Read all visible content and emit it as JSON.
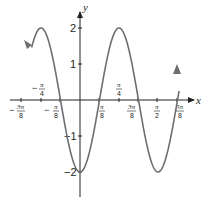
{
  "chart_data": {
    "type": "line",
    "title": "",
    "function": "y = -2cos(4x)",
    "xlabel": "x",
    "ylabel": "y",
    "xlim": [
      -0.4375,
      0.6875
    ],
    "xlim_units": "multiples of pi",
    "ylim": [
      -2.6,
      2.5
    ],
    "grid": false,
    "legend": null,
    "x_ticks": [
      {
        "value": "-3pi/8",
        "label_num": "3π",
        "label_den": "8",
        "sign": "−"
      },
      {
        "value": "-pi/4",
        "label_num": "π",
        "label_den": "4",
        "sign": "−"
      },
      {
        "value": "-pi/8",
        "label_num": "π",
        "label_den": "8",
        "sign": "−"
      },
      {
        "value": "pi/8",
        "label_num": "π",
        "label_den": "8",
        "sign": ""
      },
      {
        "value": "pi/4",
        "label_num": "π",
        "label_den": "4",
        "sign": ""
      },
      {
        "value": "3pi/8",
        "label_num": "3π",
        "label_den": "8",
        "sign": ""
      },
      {
        "value": "pi/2",
        "label_num": "π",
        "label_den": "2",
        "sign": ""
      },
      {
        "value": "5pi/8",
        "label_num": "5π",
        "label_den": "8",
        "sign": ""
      }
    ],
    "y_ticks": [
      {
        "value": 2,
        "label": "2"
      },
      {
        "value": 1,
        "label": "1"
      },
      {
        "value": -1,
        "label": "−1"
      },
      {
        "value": -2,
        "label": "−2"
      }
    ],
    "series": [
      {
        "name": "y = -2cos(4x)",
        "color": "#6d6e71",
        "x": [
          "-5pi/16",
          "-pi/4",
          "-3pi/16",
          "-pi/8",
          "-pi/16",
          "0",
          "pi/16",
          "pi/8",
          "3pi/16",
          "pi/4",
          "5pi/16",
          "3pi/8",
          "7pi/16",
          "pi/2",
          "9pi/16",
          "5pi/8"
        ],
        "y": [
          0.8,
          2,
          1.41,
          0,
          -1.41,
          -2,
          -1.41,
          0,
          1.41,
          2,
          1.41,
          0,
          -1.41,
          -2,
          -1.41,
          0.8
        ]
      }
    ],
    "annotations": [
      "arrow at left end pointing down",
      "arrow at right end pointing up"
    ]
  },
  "axis_labels": {
    "x": "x",
    "y": "y"
  },
  "colors": {
    "curve": "#6d6e71",
    "axis": "#231f20"
  }
}
